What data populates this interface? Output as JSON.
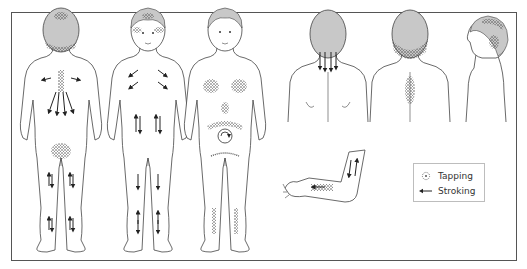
{
  "figure": {
    "views": [
      {
        "id": "full-back",
        "label": "Child full body, back view"
      },
      {
        "id": "full-front-arrows",
        "label": "Child full body, front view with stroking"
      },
      {
        "id": "full-front-tapping",
        "label": "Child full body, front view with tapping"
      },
      {
        "id": "upper-back-neck",
        "label": "Upper back view, neck stroking"
      },
      {
        "id": "upper-back-tapping",
        "label": "Upper back view, occiput and spine tapping"
      },
      {
        "id": "head-profile",
        "label": "Head side profile, tapping"
      },
      {
        "id": "forearm",
        "label": "Forearm with tapping and stroking"
      }
    ],
    "colors": {
      "outline": "#444444",
      "hair": "#c8c8c8",
      "border": "#555555",
      "tapping": "#333333",
      "stroking": "#222222"
    }
  },
  "legend": {
    "items": [
      {
        "icon": "tapping-icon",
        "label": "Tapping"
      },
      {
        "icon": "stroking-arrow-icon",
        "label": "Stroking"
      }
    ]
  }
}
